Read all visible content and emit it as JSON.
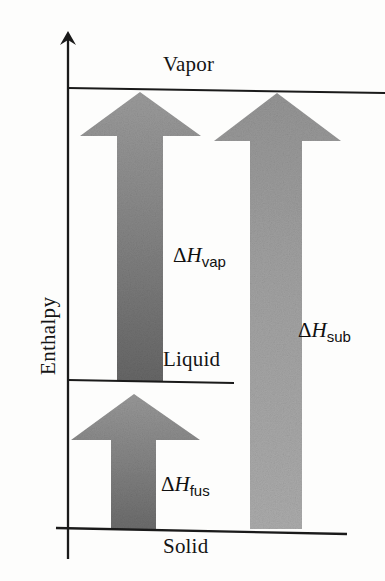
{
  "figure": {
    "type": "diagram",
    "axis": {
      "y_label": "Enthalpy",
      "y_axis_direction": "up",
      "arrowhead": "up-arrow-icon"
    },
    "phase_levels": [
      {
        "name": "Vapor",
        "label": "Vapor",
        "level": "high",
        "line_y": 89
      },
      {
        "name": "Liquid",
        "label": "Liquid",
        "level": "middle",
        "line_y": 381
      },
      {
        "name": "Solid",
        "label": "Solid",
        "level": "low",
        "line_y": 529
      }
    ],
    "transitions": [
      {
        "id": "vaporization",
        "symbol": "Δ",
        "variable": "H",
        "subscript": "vap",
        "label": "ΔH_vap",
        "from": "Liquid",
        "to": "Vapor",
        "color_top": "#8e8e8e",
        "color_bottom": "#6d6d6d"
      },
      {
        "id": "sublimation",
        "symbol": "Δ",
        "variable": "H",
        "subscript": "sub",
        "label": "ΔH_sub",
        "from": "Solid",
        "to": "Vapor",
        "color_top": "#9a9a9a",
        "color_bottom": "#a6a6a6"
      },
      {
        "id": "fusion",
        "symbol": "Δ",
        "variable": "H",
        "subscript": "fus",
        "label": "ΔH_fus",
        "from": "Solid",
        "to": "Liquid",
        "color_top": "#949494",
        "color_bottom": "#6f6f6f"
      }
    ],
    "colors": {
      "background": "#fdfdfc",
      "line": "#1a1a1a",
      "text": "#141414",
      "arrow_light": "#9a9a9a",
      "arrow_dark": "#6d6d6d"
    }
  }
}
